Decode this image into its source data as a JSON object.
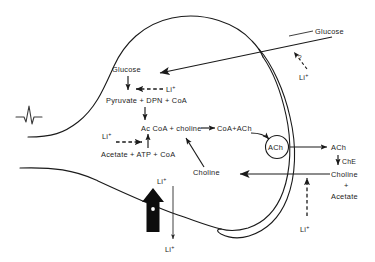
{
  "diagram": {
    "background_color": "#ffffff",
    "ink_color": "#1a1a1a",
    "labels": {
      "glucose_external": "Glucose",
      "glucose_internal": "Glucose",
      "pyruvate_line": "Pyruvate + DPN + CoA",
      "accoa_line": "Ac CoA + choline",
      "coa_ach_line": "CoA+ACh",
      "acetate_line": "Acetate + ATP + CoA",
      "choline_internal": "Choline",
      "vesicle": "ACh",
      "ach_released": "ACh",
      "che": "ChE",
      "choline_external": "Choline",
      "plus_sign": "+",
      "acetate_external": "Acetate",
      "question_mark": "?"
    },
    "lithium_labels": {
      "li_glycolysis": "Li",
      "li_acetate": "Li",
      "li_external_top": "Li",
      "li_influx": "Li",
      "li_efflux": "Li",
      "li_cleft": "Li",
      "superscript": "+"
    },
    "arrows": [
      {
        "name": "glucose-uptake",
        "style": "solid",
        "from": "external glucose",
        "to": "terminal interior"
      },
      {
        "name": "glucose-to-pyruvate",
        "style": "solid",
        "direction": "down"
      },
      {
        "name": "li-inhibits-glycolysis",
        "style": "dashed",
        "direction": "left"
      },
      {
        "name": "pyruvate-to-accoa",
        "style": "solid",
        "direction": "down"
      },
      {
        "name": "acetate-to-accoa",
        "style": "solid",
        "direction": "up"
      },
      {
        "name": "li-inhibits-acetate",
        "style": "dashed",
        "direction": "right"
      },
      {
        "name": "accoa-to-coa-ach",
        "style": "solid",
        "direction": "right"
      },
      {
        "name": "choline-to-accoa",
        "style": "solid",
        "direction": "up-right"
      },
      {
        "name": "ach-into-vesicle",
        "style": "solid",
        "direction": "curved"
      },
      {
        "name": "ach-release",
        "style": "solid",
        "direction": "right"
      },
      {
        "name": "che-hydrolysis",
        "style": "solid",
        "direction": "down"
      },
      {
        "name": "choline-reuptake",
        "style": "solid",
        "direction": "left"
      },
      {
        "name": "li-cleft-entry",
        "style": "dashed",
        "direction": "up"
      },
      {
        "name": "li-external-uptake",
        "style": "dashed",
        "direction": "up-left"
      },
      {
        "name": "li-influx-fat",
        "style": "solid-fat",
        "direction": "up"
      },
      {
        "name": "li-efflux",
        "style": "thin",
        "direction": "down"
      }
    ],
    "features": {
      "action_potential": "spike waveform on axon",
      "vesicle_shape": "circle",
      "membrane_shape": "bouton with synaptic cleft"
    }
  }
}
